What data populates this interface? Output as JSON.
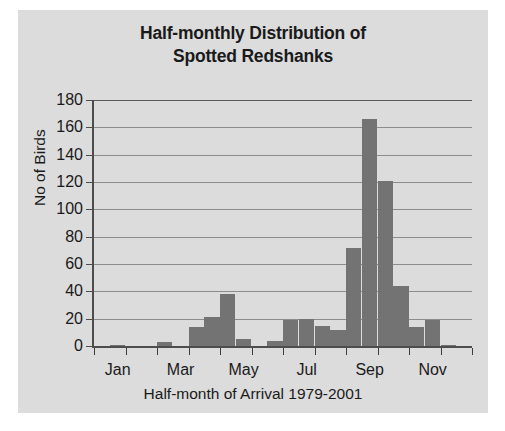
{
  "figure": {
    "background_color": "#dcdcdc",
    "page_background_color": "#ffffff",
    "bar_color": "#737373",
    "axis_color": "#4d4d4d",
    "grid_color": "#8c8c8c"
  },
  "title_lines": [
    "Half-monthly Distribution of",
    "Spotted Redshanks"
  ],
  "chart_data": {
    "type": "bar",
    "title": "Half-monthly Distribution of Spotted Redshanks",
    "xlabel": "Half-month of Arrival 1979-2001",
    "ylabel": "No of Birds",
    "ylim": [
      0,
      180
    ],
    "yticks": [
      0,
      20,
      40,
      60,
      80,
      100,
      120,
      140,
      160,
      180
    ],
    "ytick_labels": [
      "0",
      "20",
      "40",
      "60",
      "80",
      "100",
      "120",
      "140",
      "160",
      "180"
    ],
    "grid": true,
    "legend": "none",
    "xtick_labels": [
      "Jan",
      "Mar",
      "May",
      "Jul",
      "Sep",
      "Nov"
    ],
    "xtick_label_positions": [
      1,
      5,
      9,
      13,
      17,
      21
    ],
    "categories": [
      "Jan (1st half)",
      "Jan (2nd half)",
      "Feb (1st half)",
      "Feb (2nd half)",
      "Mar (1st half)",
      "Mar (2nd half)",
      "Apr (1st half)",
      "Apr (2nd half)",
      "May (1st half)",
      "May (2nd half)",
      "Jun (1st half)",
      "Jun (2nd half)",
      "Jul (1st half)",
      "Jul (2nd half)",
      "Aug (1st half)",
      "Aug (2nd half)",
      "Sep (1st half)",
      "Sep (2nd half)",
      "Oct (1st half)",
      "Oct (2nd half)",
      "Nov (1st half)",
      "Nov (2nd half)",
      "Dec (1st half)",
      "Dec (2nd half)"
    ],
    "values": [
      0,
      1,
      0,
      0,
      3,
      0,
      14,
      21,
      38,
      5,
      0,
      4,
      19,
      20,
      15,
      12,
      72,
      166,
      121,
      44,
      14,
      19,
      1,
      0
    ]
  }
}
